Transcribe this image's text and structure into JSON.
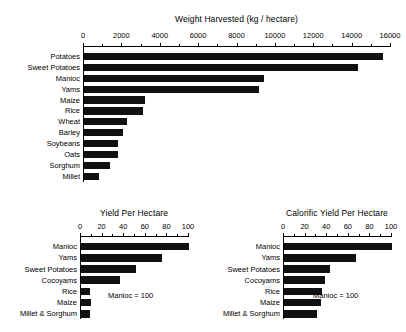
{
  "figure": {
    "background": "#ffffff",
    "bar_color": "#111111"
  },
  "chart_data": [
    {
      "id": "weight-harvested",
      "type": "bar",
      "orientation": "horizontal",
      "title": "Weight Harvested (kg / hectare)",
      "xlabel": "",
      "ylabel": "",
      "xlim": [
        0,
        16000
      ],
      "xticks": [
        0,
        2000,
        4000,
        6000,
        8000,
        10000,
        12000,
        14000,
        16000
      ],
      "xtick_labels": [
        "0",
        "2000",
        "4000",
        "6000",
        "8000",
        "10000",
        "12000",
        "14000",
        "16000"
      ],
      "grid": false,
      "legend": null,
      "categories": [
        "Potatoes",
        "Sweet Potatoes",
        "Manioc",
        "Yams",
        "Maize",
        "Rice",
        "Wheat",
        "Barley",
        "Soybeans",
        "Oats",
        "Sorghum",
        "Millet"
      ],
      "values": [
        15600,
        14300,
        9400,
        9100,
        3200,
        3100,
        2250,
        2050,
        1750,
        1750,
        1350,
        800
      ]
    },
    {
      "id": "yield-per-hectare",
      "type": "bar",
      "orientation": "horizontal",
      "title": "Yield Per Hectare",
      "xlabel": "",
      "ylabel": "",
      "xlim": [
        0,
        100
      ],
      "xticks": [
        0,
        20,
        40,
        60,
        80,
        100
      ],
      "xtick_labels": [
        "0",
        "20",
        "40",
        "60",
        "80",
        "100"
      ],
      "grid": false,
      "legend": null,
      "annotation": "Manioc = 100",
      "categories": [
        "Manioc",
        "Yams",
        "Sweet Potatoes",
        "Cocoyams",
        "Rice",
        "Maize",
        "Millet & Sorghum"
      ],
      "values": [
        100,
        75,
        51,
        36,
        8,
        9,
        8
      ]
    },
    {
      "id": "calorific-yield-per-hectare",
      "type": "bar",
      "orientation": "horizontal",
      "title": "Calorific Yield Per Hectare",
      "xlabel": "",
      "ylabel": "",
      "xlim": [
        0,
        100
      ],
      "xticks": [
        0,
        20,
        40,
        60,
        80,
        100
      ],
      "xtick_labels": [
        "0",
        "20",
        "40",
        "60",
        "80",
        "100"
      ],
      "grid": false,
      "legend": null,
      "annotation": "Manioc = 100",
      "categories": [
        "Manioc",
        "Yams",
        "Sweet Potatoes",
        "Cocoyams",
        "Rice",
        "Maize",
        "Millet & Sorghum"
      ],
      "values": [
        100,
        67,
        43,
        38,
        35,
        34,
        31
      ]
    }
  ]
}
